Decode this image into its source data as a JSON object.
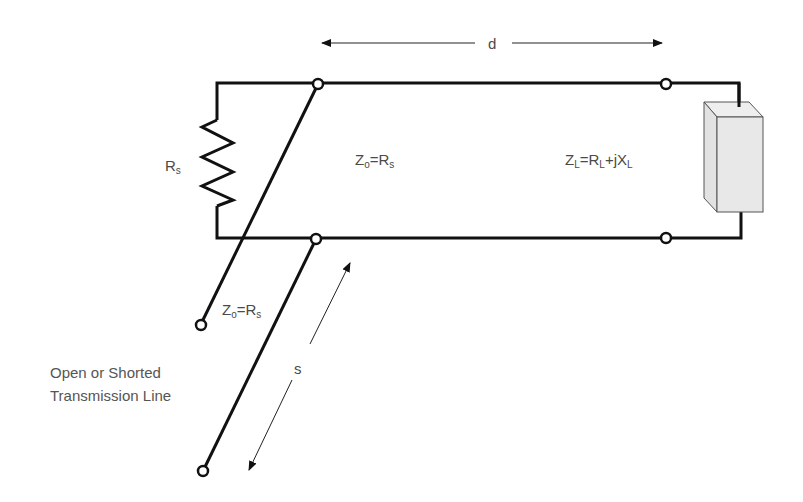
{
  "diagram": {
    "labels": {
      "source_resistor": {
        "main": "R",
        "sub": "s"
      },
      "line_impedance": {
        "z": "Z",
        "zsub": "o",
        "eq": "=R",
        "rsub": "s"
      },
      "load_impedance": {
        "z": "Z",
        "zsub": "L",
        "eq1": "=R",
        "rsub": "L",
        "plus": "+jX",
        "xsub": "L"
      },
      "stub_impedance": {
        "z": "Z",
        "zsub": "o",
        "eq": "=R",
        "rsub": "s"
      },
      "distance_d": "d",
      "distance_s": "s",
      "stub_caption": [
        "Open or Shorted",
        "Transmission Line"
      ]
    },
    "colors": {
      "wire": "#111111",
      "text": "#4a4a4a",
      "load_fill": "#e6e6e6"
    }
  }
}
